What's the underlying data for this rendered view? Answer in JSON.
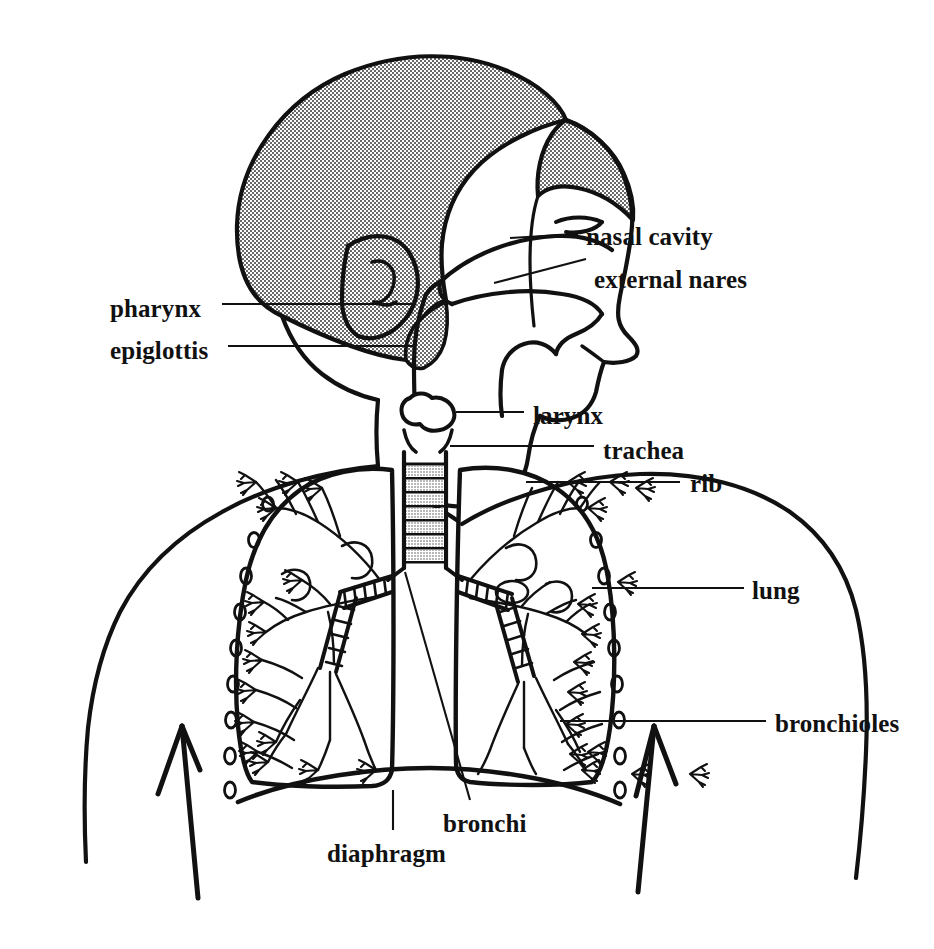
{
  "diagram": {
    "background_color": "#ffffff",
    "ink_color": "#111111",
    "hair_fill": "stipple-gray",
    "labels": [
      {
        "id": "nasal-cavity",
        "text": "nasal cavity",
        "x": 586,
        "y": 224,
        "anchor": "left"
      },
      {
        "id": "external-nares",
        "text": "external nares",
        "x": 594,
        "y": 267,
        "anchor": "left"
      },
      {
        "id": "pharynx",
        "text": "pharynx",
        "x": 110,
        "y": 296,
        "anchor": "left"
      },
      {
        "id": "epiglottis",
        "text": "epiglottis",
        "x": 110,
        "y": 338,
        "anchor": "left"
      },
      {
        "id": "larynx",
        "text": "larynx",
        "x": 533,
        "y": 403,
        "anchor": "left"
      },
      {
        "id": "trachea",
        "text": "trachea",
        "x": 603,
        "y": 438,
        "anchor": "left"
      },
      {
        "id": "rib",
        "text": "rib",
        "x": 690,
        "y": 471,
        "anchor": "left"
      },
      {
        "id": "lung",
        "text": "lung",
        "x": 752,
        "y": 578,
        "anchor": "left"
      },
      {
        "id": "bronchioles",
        "text": "bronchioles",
        "x": 775,
        "y": 711,
        "anchor": "left"
      },
      {
        "id": "bronchi",
        "text": "bronchi",
        "x": 443,
        "y": 811,
        "anchor": "left"
      },
      {
        "id": "diaphragm",
        "text": "diaphragm",
        "x": 327,
        "y": 841,
        "anchor": "left"
      }
    ],
    "structures": [
      "head-profile",
      "hair",
      "ear",
      "eye",
      "nose",
      "nasal-cavity-space",
      "tongue",
      "oral-cavity",
      "pharynx-passage",
      "epiglottis-flap",
      "larynx",
      "trachea-rings",
      "left-lung",
      "right-lung",
      "bronchial-tree",
      "bronchi-rings",
      "ribs",
      "diaphragm-curve",
      "torso-outline",
      "left-arrow",
      "right-arrow"
    ]
  }
}
